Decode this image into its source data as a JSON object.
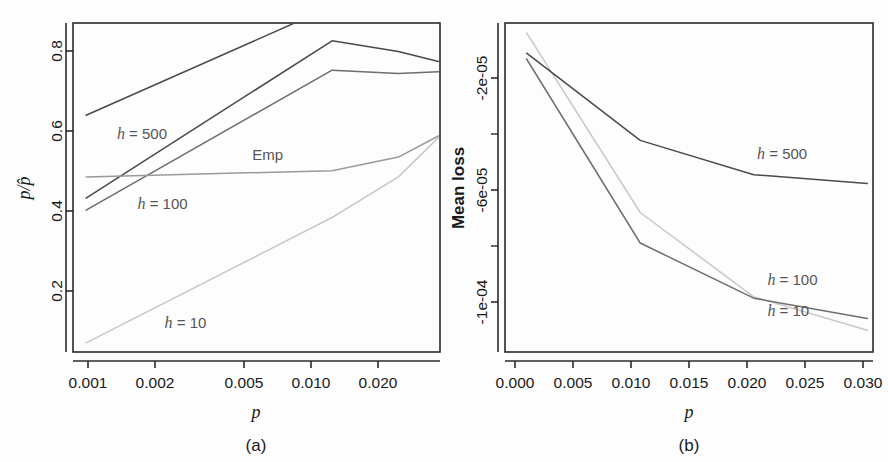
{
  "figure": {
    "background": "#fdfdfd",
    "panels": [
      "(a)",
      "(b)"
    ]
  },
  "panel_a": {
    "caption": "(a)",
    "xlabel": "p",
    "ylabel_numerator": "p",
    "ylabel_denominator": "p̂",
    "ylabel": "p/p̂",
    "xticklabels": [
      "0.001",
      "0.002",
      "0.005",
      "0.010",
      "0.020"
    ],
    "yticklabels": [
      "0.2",
      "0.4",
      "0.6",
      "0.8"
    ],
    "series_labels": {
      "h500": "h = 500",
      "h100": "h = 100",
      "h10": "h = 10",
      "emp": "Emp"
    }
  },
  "panel_b": {
    "caption": "(b)",
    "xlabel": "p",
    "ylabel": "Mean loss",
    "xticklabels": [
      "0.000",
      "0.005",
      "0.010",
      "0.015",
      "0.020",
      "0.025",
      "0.030"
    ],
    "yticklabels": [
      "-2e-05",
      "-6e-05",
      "-1e-04"
    ],
    "series_labels": {
      "h500": "h = 500",
      "h100": "h = 100",
      "h10": "h = 10"
    }
  },
  "colors": {
    "axis": "#2a2a2a",
    "h500": "#4a4a4a",
    "h100": "#6e6e6e",
    "h10": "#c8c8c8",
    "emp": "#9a9a9a",
    "text": "#1a1a1a",
    "label_gray": "#555555"
  },
  "chart_data": [
    {
      "type": "line",
      "panel": "(a)",
      "title": "",
      "xlabel": "p",
      "ylabel": "p/p-hat",
      "xscale": "log",
      "xlim": [
        0.00088,
        0.0315
      ],
      "ylim": [
        0.1,
        0.895
      ],
      "xticks": [
        0.001,
        0.002,
        0.005,
        0.01,
        0.02
      ],
      "xticklabels": [
        "0.001",
        "0.002",
        "0.005",
        "0.010",
        "0.020"
      ],
      "yticks": [
        0.2,
        0.4,
        0.6,
        0.8
      ],
      "yticklabels": [
        "0.2",
        "0.4",
        "0.6",
        "0.8"
      ],
      "grid": false,
      "legend": "in-plot annotations",
      "series": [
        {
          "name": "h = 500",
          "color": "#4a4a4a",
          "x": [
            0.001,
            0.011,
            0.021,
            0.031
          ],
          "values": [
            0.672,
            0.935,
            0.985,
            1.01
          ],
          "note": "clipped at top of panel"
        },
        {
          "name": "h = 100",
          "color": "#4a4a4a",
          "x": [
            0.001,
            0.011,
            0.021,
            0.031
          ],
          "values": [
            0.472,
            0.852,
            0.826,
            0.802
          ]
        },
        {
          "name": "h = 10",
          "color": "#c8c8c8",
          "x": [
            0.001,
            0.011,
            0.021,
            0.031
          ],
          "values": [
            0.122,
            0.425,
            0.523,
            0.618
          ]
        },
        {
          "name": "Emp",
          "color": "#9a9a9a",
          "x": [
            0.001,
            0.011,
            0.021,
            0.031
          ],
          "values": [
            0.523,
            0.538,
            0.571,
            0.622
          ]
        },
        {
          "name": "h = 100 (upper branch)",
          "color": "#6e6e6e",
          "x": [
            0.001,
            0.011,
            0.021,
            0.031
          ],
          "values": [
            0.443,
            0.781,
            0.773,
            0.777
          ]
        }
      ],
      "annotations": [
        {
          "text": "h = 500",
          "x": 0.00135,
          "y": 0.615
        },
        {
          "text": "h = 100",
          "x": 0.00165,
          "y": 0.445
        },
        {
          "text": "h = 10",
          "x": 0.00215,
          "y": 0.158
        },
        {
          "text": "Emp",
          "x": 0.00505,
          "y": 0.565
        }
      ]
    },
    {
      "type": "line",
      "panel": "(b)",
      "title": "",
      "xlabel": "p",
      "ylabel": "Mean loss",
      "xscale": "linear",
      "xlim": [
        -0.0009,
        0.0315
      ],
      "ylim": [
        -0.000118,
        -4.8e-06
      ],
      "xticks": [
        0.0,
        0.005,
        0.01,
        0.015,
        0.02,
        0.025,
        0.03
      ],
      "xticklabels": [
        "0.000",
        "0.005",
        "0.010",
        "0.015",
        "0.020",
        "0.025",
        "0.030"
      ],
      "yticks": [
        -2e-05,
        -6e-05,
        -0.0001
      ],
      "yticklabels": [
        "-2e-05",
        "-6e-05",
        "-1e-04"
      ],
      "yminorticks": [
        -4e-05,
        -8e-05
      ],
      "grid": false,
      "legend": "in-plot annotations",
      "series": [
        {
          "name": "h = 500",
          "color": "#4a4a4a",
          "x": [
            0.001,
            0.011,
            0.021,
            0.031
          ],
          "values": [
            -1.52e-05,
            -4.52e-05,
            -5.7e-05,
            -6e-05
          ]
        },
        {
          "name": "h = 100",
          "color": "#6e6e6e",
          "x": [
            0.001,
            0.011,
            0.021,
            0.031
          ],
          "values": [
            -1.72e-05,
            -8.05e-05,
            -9.95e-05,
            -0.0001065
          ]
        },
        {
          "name": "h = 10",
          "color": "#c8c8c8",
          "x": [
            0.001,
            0.011,
            0.021,
            0.031
          ],
          "values": [
            -8.2e-06,
            -7e-05,
            -9.9e-05,
            -0.0001105
          ]
        }
      ],
      "annotations": [
        {
          "text": "h = 500",
          "x": 0.0213,
          "y": -5.15e-05
        },
        {
          "text": "h = 100",
          "x": 0.0222,
          "y": -9.48e-05
        },
        {
          "text": "h = 10",
          "x": 0.0222,
          "y": -0.0001055
        }
      ]
    }
  ]
}
